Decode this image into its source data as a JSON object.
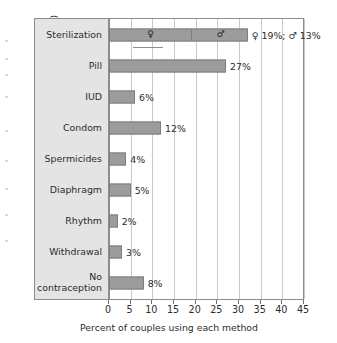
{
  "chart_data": {
    "type": "bar",
    "orientation": "horizontal",
    "title": "",
    "xlabel": "Percent of couples using each method",
    "ylabel": "Methods in decreasing order of effectiveness (top to bottom)",
    "xlim": [
      0,
      45
    ],
    "xticks": [
      0,
      5,
      10,
      15,
      20,
      25,
      30,
      35,
      40,
      45
    ],
    "grid": true,
    "legend": "none",
    "categories": [
      "Sterilization",
      "Pill",
      "IUD",
      "Condom",
      "Spermicides",
      "Diaphragm",
      "Rhythm",
      "Withdrawal",
      "No\ncontraception"
    ],
    "values": [
      32,
      27,
      6,
      12,
      4,
      5,
      2,
      3,
      8
    ],
    "value_labels": [
      "♀ 19%; ♂ 13%",
      "27%",
      "6%",
      "12%",
      "4%",
      "5%",
      "2%",
      "3%",
      "8%"
    ],
    "segmented_bars": {
      "Sterilization": {
        "segments": [
          {
            "symbol": "♀",
            "value": 19,
            "label": "19%"
          },
          {
            "symbol": "♂",
            "value": 13,
            "label": "13%"
          }
        ],
        "total": 32
      }
    },
    "colors": {
      "bar_fill": "#9c9c9c",
      "bar_edge": "#7d7d7d",
      "panel_fill": "#e4e4e4",
      "gridline": "#c9c9c9",
      "axis": "#8c8c8c",
      "text": "#2b2b2b",
      "background": "#ffffff"
    }
  },
  "axis": {
    "x_title": "Percent of couples using each method",
    "y_title": "Methods in decreasing order of effectiveness (top to bottom)",
    "x_tick_labels": [
      "0",
      "5",
      "10",
      "15",
      "20",
      "25",
      "30",
      "35",
      "40",
      "45"
    ]
  },
  "rows": [
    {
      "name": "Sterilization",
      "label": "Sterilization",
      "value": 32,
      "value_label": "♀ 19%; ♂ 13%",
      "segments": [
        19,
        13
      ],
      "segment_symbols": [
        "♀",
        "♂"
      ]
    },
    {
      "name": "Pill",
      "label": "Pill",
      "value": 27,
      "value_label": "27%"
    },
    {
      "name": "IUD",
      "label": "IUD",
      "value": 6,
      "value_label": "6%"
    },
    {
      "name": "Condom",
      "label": "Condom",
      "value": 12,
      "value_label": "12%"
    },
    {
      "name": "Spermicides",
      "label": "Spermicides",
      "value": 4,
      "value_label": "4%"
    },
    {
      "name": "Diaphragm",
      "label": "Diaphragm",
      "value": 5,
      "value_label": "5%"
    },
    {
      "name": "Rhythm",
      "label": "Rhythm",
      "value": 2,
      "value_label": "2%"
    },
    {
      "name": "Withdrawal",
      "label": "Withdrawal",
      "value": 3,
      "value_label": "3%"
    },
    {
      "name": "No contraception",
      "label": "No\ncontraception",
      "value": 8,
      "value_label": "8%"
    }
  ]
}
